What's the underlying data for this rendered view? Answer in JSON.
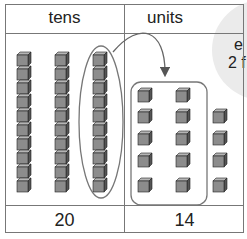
{
  "table": {
    "headers": {
      "tens": "tens",
      "units": "units"
    },
    "totals": {
      "tens": "20",
      "units": "14"
    }
  },
  "blocks": {
    "tens_rods": 2,
    "regrouped_rod_units": 10,
    "unit_cubes": 14,
    "grouped_units": 10,
    "remaining_units": 4
  },
  "bubble": {
    "line1": "e",
    "line2": "2 f"
  },
  "colors": {
    "cube": "#8a8a8a",
    "cube_top": "#b0b0b0",
    "cube_side": "#5a5a5a",
    "bubble": "#ebebeb",
    "line": "#777777"
  }
}
